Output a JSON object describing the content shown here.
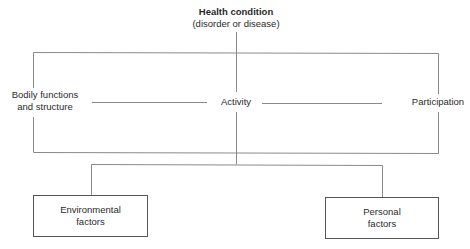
{
  "diagram": {
    "type": "ICF model flow diagram",
    "root": {
      "title": "Health condition",
      "subtitle": "(disorder or disease)"
    },
    "middle_row": [
      {
        "id": "bodily",
        "line1": "Bodily functions",
        "line2": "and structure"
      },
      {
        "id": "activity",
        "label": "Activity"
      },
      {
        "id": "participation",
        "label": "Participation"
      }
    ],
    "factors": [
      {
        "id": "environmental",
        "line1": "Environmental",
        "line2": "factors"
      },
      {
        "id": "personal",
        "line1": "Personal",
        "line2": "factors"
      }
    ],
    "colors": {
      "line": "#8a8a8a",
      "box_border": "#555555",
      "text": "#2a2a2a",
      "background": "#ffffff"
    }
  }
}
